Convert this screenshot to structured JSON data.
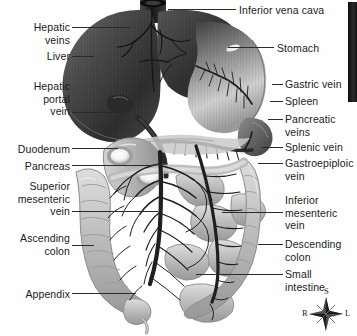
{
  "figure": {
    "type": "anatomical-illustration",
    "background_color": "#fefefe",
    "line_color": "#2a2a2a",
    "text_color": "#1b1b1b"
  },
  "labels_left": [
    {
      "id": "hepatic-veins",
      "text": "Hepatic\nveins",
      "x": 8,
      "y": 21,
      "align": "right",
      "width": 62
    },
    {
      "id": "liver",
      "text": "Liver",
      "x": 8,
      "y": 50,
      "align": "right",
      "width": 62
    },
    {
      "id": "hepatic-portal-vein",
      "text": "Hepatic\nportal\nvein",
      "x": 8,
      "y": 80,
      "align": "right",
      "width": 62
    },
    {
      "id": "duodenum",
      "text": "Duodenum",
      "x": 2,
      "y": 143,
      "align": "right",
      "width": 68
    },
    {
      "id": "pancreas",
      "text": "Pancreas",
      "x": 2,
      "y": 160,
      "align": "right",
      "width": 68
    },
    {
      "id": "superior-mesenteric-vein",
      "text": "Superior\nmesenteric\nvein",
      "x": 2,
      "y": 180,
      "align": "right",
      "width": 68
    },
    {
      "id": "ascending-colon",
      "text": "Ascending\ncolon",
      "x": 2,
      "y": 232,
      "align": "right",
      "width": 68
    },
    {
      "id": "appendix",
      "text": "Appendix",
      "x": 2,
      "y": 288,
      "align": "right",
      "width": 68
    }
  ],
  "labels_right": [
    {
      "id": "inferior-vena-cava",
      "text": "Inferior vena cava",
      "x": 239,
      "y": 4,
      "align": "left"
    },
    {
      "id": "stomach",
      "text": "Stomach",
      "x": 277,
      "y": 42,
      "align": "left"
    },
    {
      "id": "gastric-vein",
      "text": "Gastric vein",
      "x": 285,
      "y": 78,
      "align": "left"
    },
    {
      "id": "spleen",
      "text": "Spleen",
      "x": 285,
      "y": 95,
      "align": "left"
    },
    {
      "id": "pancreatic-veins",
      "text": "Pancreatic\nveins",
      "x": 285,
      "y": 113,
      "align": "left"
    },
    {
      "id": "splenic-vein",
      "text": "Splenic vein",
      "x": 285,
      "y": 141,
      "align": "left"
    },
    {
      "id": "gastroepiploic-vein",
      "text": "Gastroepiploic\nvein",
      "x": 285,
      "y": 157,
      "align": "left"
    },
    {
      "id": "inferior-mesenteric-vein",
      "text": "Inferior\nmesenteric\nvein",
      "x": 285,
      "y": 194,
      "align": "left"
    },
    {
      "id": "descending-colon",
      "text": "Descending\ncolon",
      "x": 285,
      "y": 238,
      "align": "left"
    },
    {
      "id": "small-intestine",
      "text": "Small\nintestine",
      "x": 285,
      "y": 268,
      "align": "left"
    }
  ],
  "compass": {
    "superior": "S",
    "right": "R",
    "left": "L"
  }
}
